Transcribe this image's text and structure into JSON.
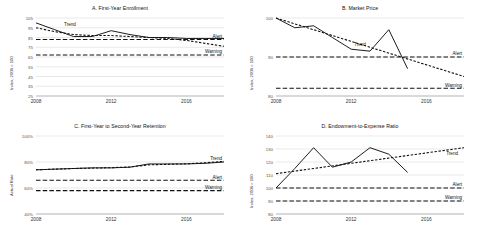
{
  "figure": {
    "threshold_labels": {
      "trend": "Trend",
      "alert": "Alert",
      "warning": "Warning"
    }
  },
  "chart_data": [
    {
      "id": "A",
      "type": "line",
      "title": "A. First-Year Enrollment",
      "xlabel": "",
      "ylabel": "Index, 2008 = 100",
      "xlim": [
        2008,
        2018
      ],
      "ylim": [
        25,
        105
      ],
      "yticks": [
        105,
        95,
        85,
        75,
        65,
        55,
        45,
        35,
        25
      ],
      "xticks": [
        2008,
        2012,
        2016
      ],
      "grid": true,
      "legend": "inline-annotations",
      "alert_label": "Alert",
      "alert_value": 83,
      "warning_label": "Warning",
      "warning_value": 67,
      "trend_label": "Trend",
      "x": [
        2008,
        2009,
        2010,
        2011,
        2012,
        2013,
        2014,
        2015,
        2016,
        2017,
        2018
      ],
      "series": [
        {
          "name": "Actual",
          "style": "solid",
          "values": [
            100,
            93,
            86,
            86,
            92,
            88,
            85,
            85,
            84,
            84,
            84
          ]
        },
        {
          "name": "Trend",
          "style": "dashed",
          "values": [
            95,
            91,
            88,
            87,
            87,
            86,
            85,
            84,
            82,
            79,
            76
          ]
        }
      ]
    },
    {
      "id": "B",
      "type": "line",
      "title": "B. Market Price",
      "xlabel": "",
      "ylabel": "Index, 2008 = 100",
      "xlim": [
        2008,
        2018
      ],
      "ylim": [
        80,
        100
      ],
      "yticks": [
        100,
        90,
        80
      ],
      "xticks": [
        2008,
        2012,
        2016
      ],
      "grid": true,
      "legend": "inline-annotations",
      "alert_label": "Alert",
      "alert_value": 90,
      "warning_label": "Warning",
      "warning_value": 82,
      "trend_label": "Trend",
      "x": [
        2008,
        2009,
        2010,
        2011,
        2012,
        2013,
        2014,
        2015
      ],
      "series": [
        {
          "name": "Actual",
          "style": "solid",
          "values": [
            100,
            97.5,
            98,
            95,
            92,
            91.5,
            97,
            87
          ]
        },
        {
          "name": "Trend",
          "style": "dashed",
          "values": [
            100,
            98,
            96.2,
            94.4,
            92.6,
            91,
            89.4,
            87.8
          ]
        }
      ],
      "trend_x": [
        2008,
        2018
      ],
      "trend_extended": [
        100,
        85
      ]
    },
    {
      "id": "C",
      "type": "line",
      "title": "C. First-Year to Second-Year Retention",
      "xlabel": "",
      "ylabel": "Actual Rate",
      "xlim": [
        2008,
        2018
      ],
      "ylim": [
        40,
        100
      ],
      "yticks": [
        "100%",
        "80%",
        "60%",
        "40%"
      ],
      "ytick_values": [
        100,
        80,
        60,
        40
      ],
      "xticks": [
        2008,
        2012,
        2016
      ],
      "grid": true,
      "legend": "inline-annotations",
      "alert_label": "Alert",
      "alert_value": 66,
      "warning_label": "Warning",
      "warning_value": 58,
      "trend_label": "Trend",
      "x": [
        2008,
        2009,
        2010,
        2011,
        2012,
        2013,
        2014,
        2015,
        2016,
        2017,
        2018
      ],
      "series": [
        {
          "name": "Actual",
          "style": "solid",
          "values": [
            74,
            74.5,
            75,
            75.5,
            75.5,
            76,
            78.5,
            78.5,
            78.5,
            79,
            80
          ]
        },
        {
          "name": "Trend",
          "style": "dashed",
          "values": [
            74,
            74.5,
            75,
            75.3,
            75.6,
            76.2,
            77.8,
            78.2,
            78.6,
            79.4,
            80.5
          ]
        }
      ]
    },
    {
      "id": "D",
      "type": "line",
      "title": "D. Endowment-to-Expense Ratio",
      "xlabel": "",
      "ylabel": "Index, 2008 = 100",
      "xlim": [
        2008,
        2018
      ],
      "ylim": [
        80,
        140
      ],
      "yticks": [
        140,
        130,
        120,
        110,
        100,
        90,
        80
      ],
      "xticks": [
        2008,
        2012,
        2016
      ],
      "grid": true,
      "legend": "inline-annotations",
      "alert_label": "Alert",
      "alert_value": 100,
      "warning_label": "Warning",
      "warning_value": 90,
      "trend_label": "Trend",
      "x": [
        2008,
        2009,
        2010,
        2011,
        2012,
        2013,
        2014,
        2015
      ],
      "series": [
        {
          "name": "Actual",
          "style": "solid",
          "values": [
            100,
            115,
            131,
            116,
            120,
            131,
            126,
            112
          ]
        },
        {
          "name": "Trend",
          "style": "dashed",
          "values": [
            111,
            113,
            115,
            117,
            119,
            121,
            123,
            125
          ]
        }
      ],
      "trend_x": [
        2008,
        2018
      ],
      "trend_extended": [
        111,
        131
      ]
    }
  ]
}
